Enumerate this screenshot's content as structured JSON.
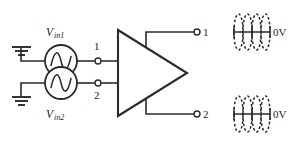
{
  "diagram": {
    "colors": {
      "ink": "#2b2b2b",
      "background": "#ffffff"
    },
    "sources": [
      {
        "name": "source-1",
        "label_main": "V",
        "label_sub": "in1",
        "label_full": "Vin1",
        "label_position": "above",
        "symbol": "ac-sine-source"
      },
      {
        "name": "source-2",
        "label_main": "V",
        "label_sub": "in2",
        "label_full": "Vin2",
        "label_position": "below",
        "symbol": "ac-sine-source"
      }
    ],
    "grounds": [
      {
        "name": "ground-1",
        "symbol": "earth-ground"
      },
      {
        "name": "ground-2",
        "symbol": "earth-ground"
      }
    ],
    "input_terminals": [
      {
        "name": "input-terminal-1",
        "label": "1",
        "label_position": "above"
      },
      {
        "name": "input-terminal-2",
        "label": "2",
        "label_position": "below"
      }
    ],
    "amplifier": {
      "name": "amplifier-triangle",
      "symbol": "triangle-amplifier",
      "label": ""
    },
    "output_terminals": [
      {
        "name": "output-terminal-1",
        "label": "1",
        "label_position": "right"
      },
      {
        "name": "output-terminal-2",
        "label": "2",
        "label_position": "right"
      }
    ],
    "waveforms": [
      {
        "name": "output-waveform-1",
        "axis_label": "0V",
        "style": "dashed",
        "description": "sine and inverted sine overlapped about the 0V axis"
      },
      {
        "name": "output-waveform-2",
        "axis_label": "0V",
        "style": "dashed",
        "description": "sine and inverted sine overlapped about the 0V axis"
      }
    ]
  }
}
